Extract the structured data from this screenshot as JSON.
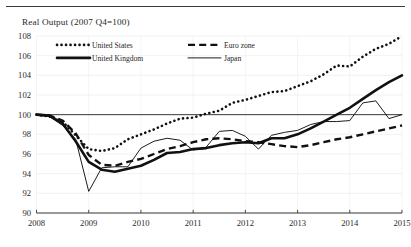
{
  "chart_data": {
    "type": "line",
    "title": "Real Output (2007  Q4=100)",
    "xlabel": "",
    "ylabel": "",
    "xlim": [
      2008.0,
      2015.0
    ],
    "ylim": [
      90,
      108
    ],
    "ytick_step": 2,
    "yticks": [
      90,
      92,
      94,
      96,
      98,
      100,
      102,
      104,
      106,
      108
    ],
    "xticks": [
      2008,
      2009,
      2010,
      2011,
      2012,
      2013,
      2014,
      2015
    ],
    "xtick_labels": [
      "2008",
      "2009",
      "2010",
      "2011",
      "2012",
      "2013",
      "2014",
      "2015"
    ],
    "ytick_labels": [
      "90",
      "92",
      "94",
      "96",
      "98",
      "100",
      "102",
      "104",
      "106",
      "108"
    ],
    "grid": "faint-horizontal-and-vertical",
    "reference_line": {
      "value": 100,
      "style": "solid",
      "color": "#3b3b3b"
    },
    "legend_position": "top-inside",
    "legend": [
      {
        "name": "United States",
        "style": "dotted"
      },
      {
        "name": "Euro zone",
        "style": "dashed"
      },
      {
        "name": "United Kingdom",
        "style": "solid-thick"
      },
      {
        "name": "Japan",
        "style": "solid-thin"
      }
    ],
    "series": [
      {
        "name": "United States",
        "style": "dotted",
        "color": "#111111",
        "x": [
          2008.0,
          2008.25,
          2008.5,
          2008.75,
          2009.0,
          2009.25,
          2009.5,
          2009.75,
          2010.0,
          2010.25,
          2010.5,
          2010.75,
          2011.0,
          2011.25,
          2011.5,
          2011.75,
          2012.0,
          2012.25,
          2012.5,
          2012.75,
          2013.0,
          2013.25,
          2013.5,
          2013.75,
          2014.0,
          2014.25,
          2014.5,
          2014.75,
          2015.0
        ],
        "values": [
          100.0,
          99.8,
          99.3,
          97.9,
          96.5,
          96.3,
          96.6,
          97.5,
          98.0,
          98.5,
          99.1,
          99.6,
          99.7,
          100.1,
          100.4,
          101.2,
          101.5,
          101.9,
          102.3,
          102.4,
          102.9,
          103.4,
          104.1,
          105.0,
          104.9,
          105.9,
          106.7,
          107.2,
          108.0
        ]
      },
      {
        "name": "Euro zone",
        "style": "dashed",
        "color": "#111111",
        "x": [
          2008.0,
          2008.25,
          2008.5,
          2008.75,
          2009.0,
          2009.25,
          2009.5,
          2009.75,
          2010.0,
          2010.25,
          2010.5,
          2010.75,
          2011.0,
          2011.25,
          2011.5,
          2011.75,
          2012.0,
          2012.25,
          2012.5,
          2012.75,
          2013.0,
          2013.25,
          2013.5,
          2013.75,
          2014.0,
          2014.25,
          2014.5,
          2014.75,
          2015.0
        ],
        "values": [
          100.0,
          99.9,
          99.4,
          98.1,
          95.9,
          94.9,
          94.8,
          95.2,
          95.5,
          96.0,
          96.5,
          96.8,
          97.2,
          97.5,
          97.6,
          97.5,
          97.3,
          97.2,
          97.0,
          96.8,
          96.7,
          96.9,
          97.2,
          97.5,
          97.7,
          98.0,
          98.3,
          98.6,
          98.9
        ]
      },
      {
        "name": "United Kingdom",
        "style": "solid-thick",
        "color": "#111111",
        "x": [
          2008.0,
          2008.25,
          2008.5,
          2008.75,
          2009.0,
          2009.25,
          2009.5,
          2009.75,
          2010.0,
          2010.25,
          2010.5,
          2010.75,
          2011.0,
          2011.25,
          2011.5,
          2011.75,
          2012.0,
          2012.25,
          2012.5,
          2012.75,
          2013.0,
          2013.25,
          2013.5,
          2013.75,
          2014.0,
          2014.25,
          2014.5,
          2014.75,
          2015.0
        ],
        "values": [
          100.0,
          99.9,
          99.1,
          97.3,
          95.2,
          94.4,
          94.2,
          94.5,
          94.8,
          95.4,
          96.1,
          96.2,
          96.5,
          96.6,
          96.9,
          97.1,
          97.2,
          97.1,
          97.6,
          97.6,
          98.0,
          98.6,
          99.3,
          100.0,
          100.7,
          101.6,
          102.5,
          103.3,
          104.0
        ]
      },
      {
        "name": "Japan",
        "style": "solid-thin",
        "color": "#111111",
        "x": [
          2008.0,
          2008.25,
          2008.5,
          2008.75,
          2009.0,
          2009.25,
          2009.5,
          2009.75,
          2010.0,
          2010.25,
          2010.5,
          2010.75,
          2011.0,
          2011.25,
          2011.5,
          2011.75,
          2012.0,
          2012.25,
          2012.5,
          2012.75,
          2013.0,
          2013.25,
          2013.5,
          2013.75,
          2014.0,
          2014.25,
          2014.5,
          2014.75,
          2015.0
        ],
        "values": [
          100.0,
          99.8,
          98.9,
          97.5,
          92.2,
          94.6,
          94.7,
          94.7,
          96.6,
          97.3,
          97.6,
          97.4,
          96.4,
          96.7,
          98.3,
          98.4,
          97.8,
          96.5,
          97.9,
          98.2,
          98.4,
          99.0,
          99.3,
          99.3,
          99.4,
          101.2,
          101.4,
          99.6,
          100.0
        ]
      }
    ]
  }
}
